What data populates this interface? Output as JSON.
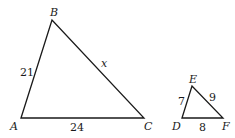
{
  "diagram": {
    "title": "",
    "triangles": [
      {
        "name": "ABC",
        "vertices": {
          "A": {
            "label": "A",
            "x": 21,
            "y": 118
          },
          "B": {
            "label": "B",
            "x": 52,
            "y": 20
          },
          "C": {
            "label": "C",
            "x": 144,
            "y": 118
          }
        },
        "sides": {
          "AB": "21",
          "AC": "24",
          "BC": "x"
        }
      },
      {
        "name": "DEF",
        "vertices": {
          "D": {
            "label": "D",
            "x": 182,
            "y": 118
          },
          "E": {
            "label": "E",
            "x": 192,
            "y": 86
          },
          "F": {
            "label": "F",
            "x": 223,
            "y": 118
          }
        },
        "sides": {
          "DE": "7",
          "DF": "8",
          "EF": "9"
        }
      }
    ]
  }
}
